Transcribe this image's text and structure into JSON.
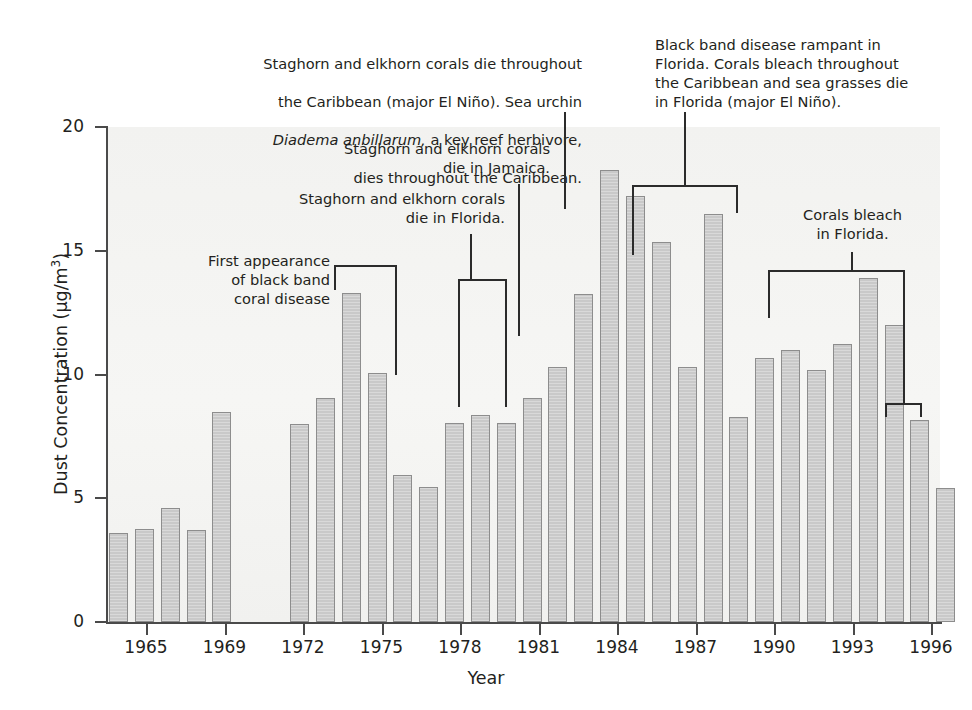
{
  "chart_data": {
    "type": "bar",
    "title": "",
    "xlabel": "Year",
    "ylabel": "Dust Concentration (µg/m3)",
    "ylabel_display": "Dust Concentration (µg/m",
    "ylim": [
      0,
      20
    ],
    "ytick_labels": [
      "0",
      "5",
      "10",
      "15",
      "20"
    ],
    "ytick_values": [
      0,
      5,
      10,
      15,
      20
    ],
    "xtick_labels": [
      "1965",
      "1969",
      "1972",
      "1975",
      "1978",
      "1981",
      "1984",
      "1987",
      "1990",
      "1993",
      "1996"
    ],
    "grid": false,
    "legend": "none",
    "categories": [
      "1964",
      "1965",
      "1966",
      "1967",
      "1968",
      "1969",
      "1970",
      "1971",
      "1972",
      "1973",
      "1974",
      "1975",
      "1976",
      "1977",
      "1978",
      "1979",
      "1980",
      "1981",
      "1982",
      "1983",
      "1984",
      "1985",
      "1986",
      "1987",
      "1988",
      "1989",
      "1990",
      "1991",
      "1992",
      "1993",
      "1994",
      "1995",
      "1996"
    ],
    "values": [
      3.6,
      3.75,
      4.6,
      3.7,
      8.5,
      null,
      null,
      8.0,
      9.05,
      13.3,
      10.05,
      5.95,
      5.45,
      8.05,
      8.35,
      8.05,
      9.05,
      10.3,
      13.25,
      18.25,
      17.2,
      15.35,
      10.3,
      16.5,
      8.3,
      10.65,
      11.0,
      10.2,
      11.25,
      13.9,
      12.0,
      8.15,
      5.4
    ],
    "bar_color": "#c9c9c9",
    "bar_edge_color": "#8d8d8d",
    "plot_background": "#f3f3f1"
  },
  "annotations": {
    "a1": {
      "name": "first-appearance-black-band",
      "text": "First appearance\nof black band\ncoral disease"
    },
    "a2": {
      "name": "staghorn-elkhorn-florida",
      "text": "Staghorn and elkhorn corals\ndie in Florida."
    },
    "a3": {
      "name": "staghorn-elkhorn-jamaica",
      "text": "Staghorn and elkhorn corals\ndie in Jamaica."
    },
    "a4": {
      "name": "staghorn-elkhorn-caribbean",
      "line1": "Staghorn and elkhorn corals die throughout",
      "line2": "the Caribbean (major El Niño). Sea urchin",
      "line3_italic": "Diadema anbillarum,",
      "line3_rest": " a key reef herbivore,",
      "line4": "dies throughout the Caribbean."
    },
    "a5": {
      "name": "black-band-rampant-florida",
      "text": "Black band disease rampant in\nFlorida. Corals bleach throughout\nthe Caribbean and sea grasses die\nin Florida (major El Niño)."
    },
    "a6": {
      "name": "corals-bleach-florida",
      "text": "Corals bleach\nin Florida."
    }
  }
}
